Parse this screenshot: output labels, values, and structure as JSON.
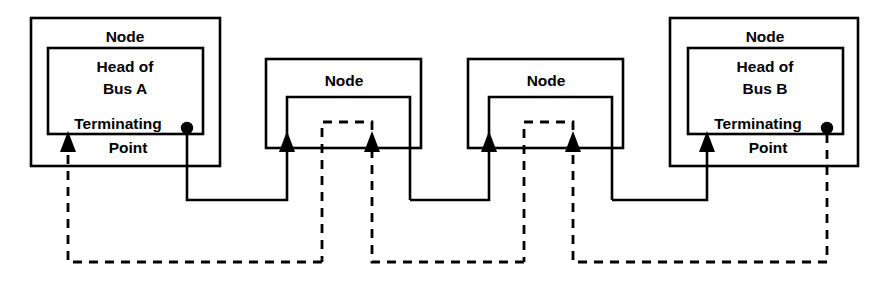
{
  "diagram": {
    "colors": {
      "stroke": "#000000",
      "background": "#ffffff"
    },
    "labels": {
      "node": "Node",
      "head_of": "Head of",
      "bus_a": "Bus A",
      "bus_b": "Bus B",
      "terminating": "Terminating",
      "point": "Point"
    },
    "nodes": [
      {
        "id": "node-head-bus-a",
        "outer_label": "Node",
        "inner_line1": "Head of",
        "inner_line2": "Bus A",
        "inner_line3": "Terminating",
        "inner_line4": "Point",
        "has_inner_box": true,
        "terminating_point": true
      },
      {
        "id": "node-middle-1",
        "outer_label": "Node",
        "inner_line1": "",
        "inner_line2": "",
        "inner_line3": "",
        "inner_line4": "",
        "has_inner_box": false,
        "terminating_point": false
      },
      {
        "id": "node-middle-2",
        "outer_label": "Node",
        "inner_line1": "",
        "inner_line2": "",
        "inner_line3": "",
        "inner_line4": "",
        "has_inner_box": false,
        "terminating_point": false
      },
      {
        "id": "node-head-bus-b",
        "outer_label": "Node",
        "inner_line1": "Head of",
        "inner_line2": "Bus B",
        "inner_line3": "Terminating",
        "inner_line4": "Point",
        "has_inner_box": true,
        "terminating_point": true
      }
    ],
    "buses": [
      {
        "id": "bus-a",
        "style": "solid",
        "direction": "left-to-right"
      },
      {
        "id": "bus-b",
        "style": "dashed",
        "direction": "right-to-left"
      }
    ]
  }
}
